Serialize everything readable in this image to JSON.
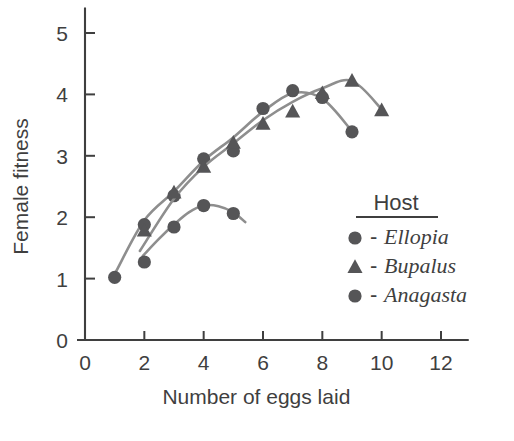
{
  "chart_data": {
    "type": "scatter",
    "title": "",
    "xlabel": "Number of eggs laid",
    "ylabel": "Female fitness",
    "xlim": [
      0,
      12.9
    ],
    "ylim": [
      0,
      5.4
    ],
    "xticks": [
      0,
      2,
      4,
      6,
      8,
      10,
      12
    ],
    "xtick_labels": [
      "0",
      "2",
      "4",
      "6",
      "8",
      "10",
      "12"
    ],
    "yticks": [
      0,
      1,
      2,
      3,
      4,
      5
    ],
    "ytick_labels": [
      "0",
      "1",
      "2",
      "3",
      "4",
      "5"
    ],
    "grid": false,
    "legend_position": "center-right",
    "legend_title": "Host",
    "series": [
      {
        "name": "Ellopia",
        "marker": "circle",
        "color": "#555557",
        "points": [
          {
            "x": 1,
            "y": 1.02
          },
          {
            "x": 2,
            "y": 1.88
          },
          {
            "x": 3,
            "y": 2.35
          },
          {
            "x": 4,
            "y": 2.95
          },
          {
            "x": 5,
            "y": 3.08
          },
          {
            "x": 6,
            "y": 3.77
          },
          {
            "x": 7,
            "y": 4.06
          },
          {
            "x": 8,
            "y": 3.95
          },
          {
            "x": 9,
            "y": 3.39
          }
        ],
        "fit_curve": [
          {
            "x": 1.05,
            "y": 1.12
          },
          {
            "x": 2,
            "y": 1.95
          },
          {
            "x": 3,
            "y": 2.42
          },
          {
            "x": 4,
            "y": 2.92
          },
          {
            "x": 5,
            "y": 3.3
          },
          {
            "x": 6,
            "y": 3.72
          },
          {
            "x": 7,
            "y": 4.02
          },
          {
            "x": 8,
            "y": 3.93
          },
          {
            "x": 9,
            "y": 3.4
          }
        ]
      },
      {
        "name": "Bupalus",
        "marker": "triangle",
        "color": "#555557",
        "points": [
          {
            "x": 2,
            "y": 1.78
          },
          {
            "x": 3,
            "y": 2.4
          },
          {
            "x": 4,
            "y": 2.82
          },
          {
            "x": 5,
            "y": 3.21
          },
          {
            "x": 6,
            "y": 3.52
          },
          {
            "x": 7,
            "y": 3.72
          },
          {
            "x": 8,
            "y": 4.02
          },
          {
            "x": 9,
            "y": 4.22
          },
          {
            "x": 10,
            "y": 3.74
          }
        ],
        "fit_curve": [
          {
            "x": 1.85,
            "y": 1.45
          },
          {
            "x": 3,
            "y": 2.3
          },
          {
            "x": 4,
            "y": 2.82
          },
          {
            "x": 5,
            "y": 3.2
          },
          {
            "x": 6,
            "y": 3.58
          },
          {
            "x": 7,
            "y": 3.88
          },
          {
            "x": 8,
            "y": 4.1
          },
          {
            "x": 9,
            "y": 4.22
          },
          {
            "x": 10,
            "y": 3.76
          }
        ]
      },
      {
        "name": "Anagasta",
        "marker": "circle",
        "color": "#555557",
        "points": [
          {
            "x": 2,
            "y": 1.27
          },
          {
            "x": 3,
            "y": 1.84
          },
          {
            "x": 4,
            "y": 2.19
          },
          {
            "x": 5,
            "y": 2.06
          }
        ],
        "fit_curve": [
          {
            "x": 1.95,
            "y": 1.37
          },
          {
            "x": 2.5,
            "y": 1.65
          },
          {
            "x": 3,
            "y": 1.88
          },
          {
            "x": 3.5,
            "y": 2.08
          },
          {
            "x": 4,
            "y": 2.19
          },
          {
            "x": 4.5,
            "y": 2.18
          },
          {
            "x": 5,
            "y": 2.08
          },
          {
            "x": 5.4,
            "y": 1.92
          }
        ]
      }
    ]
  },
  "legend": {
    "title": "Host",
    "entries": [
      {
        "dash": "-",
        "label": "Ellopia",
        "marker": "circle"
      },
      {
        "dash": "-",
        "label": "Bupalus",
        "marker": "triangle"
      },
      {
        "dash": "-",
        "label": "Anagasta",
        "marker": "circle"
      }
    ]
  }
}
